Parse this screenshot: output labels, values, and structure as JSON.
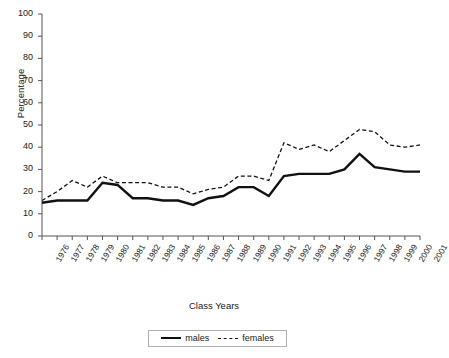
{
  "chart_data": {
    "type": "line",
    "title": "",
    "xlabel": "Class Years",
    "ylabel": "Percentage",
    "ylim": [
      0,
      100
    ],
    "yticks": [
      0,
      10,
      20,
      30,
      40,
      50,
      60,
      70,
      80,
      90,
      100
    ],
    "grid": false,
    "legend_position": "bottom-center",
    "categories": [
      "1976",
      "1977",
      "1978",
      "1979",
      "1980",
      "1981",
      "1982",
      "1983",
      "1984",
      "1985",
      "1986",
      "1987",
      "1988",
      "1989",
      "1990",
      "1991",
      "1992",
      "1993",
      "1994",
      "1995",
      "1996",
      "1997",
      "1998",
      "1999",
      "2000",
      "2001"
    ],
    "series": [
      {
        "name": "males",
        "style": "solid",
        "color": "#111111",
        "values": [
          15,
          16,
          16,
          16,
          24,
          23,
          17,
          17,
          16,
          16,
          14,
          17,
          18,
          22,
          22,
          18,
          27,
          28,
          28,
          28,
          30,
          37,
          31,
          30,
          29,
          29
        ]
      },
      {
        "name": "females",
        "style": "dashed",
        "color": "#111111",
        "values": [
          16,
          20,
          25,
          22,
          27,
          24,
          24,
          24,
          22,
          22,
          19,
          21,
          22,
          27,
          27,
          25,
          42,
          39,
          41,
          38,
          43,
          48,
          47,
          41,
          40,
          41
        ]
      }
    ]
  },
  "legend": {
    "items": [
      {
        "label": "males",
        "style": "solid"
      },
      {
        "label": "females",
        "style": "dashed"
      }
    ]
  }
}
